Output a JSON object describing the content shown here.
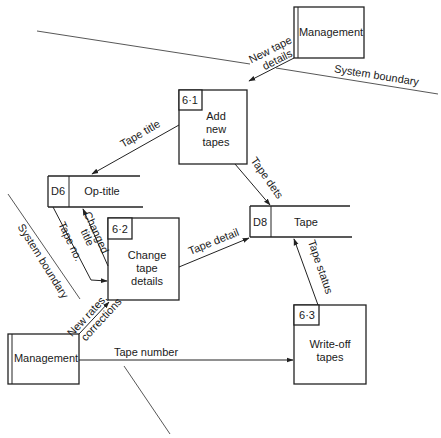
{
  "diagram": {
    "type": "data-flow-diagram",
    "boundaries": [
      {
        "id": "boundary-top",
        "label": "System boundary"
      },
      {
        "id": "boundary-left",
        "label": "System boundary"
      },
      {
        "id": "boundary-bottom",
        "label": ""
      }
    ],
    "external_entities": [
      {
        "id": "mgmt-top",
        "label": "Management"
      },
      {
        "id": "mgmt-bottom",
        "label": "Management"
      }
    ],
    "processes": [
      {
        "id": "p61",
        "number": "6·1",
        "lines": [
          "Add",
          "new",
          "tapes"
        ]
      },
      {
        "id": "p62",
        "number": "6·2",
        "lines": [
          "Change",
          "tape",
          "details"
        ]
      },
      {
        "id": "p63",
        "number": "6·3",
        "lines": [
          "Write-off",
          "tapes"
        ]
      }
    ],
    "data_stores": [
      {
        "id": "d6",
        "code": "D6",
        "label": "Op-title"
      },
      {
        "id": "d8",
        "code": "D8",
        "label": "Tape"
      }
    ],
    "flows": [
      {
        "id": "f1",
        "from": "mgmt-top",
        "to": "p61",
        "lines": [
          "New tape",
          "details"
        ]
      },
      {
        "id": "f2",
        "from": "p61",
        "to": "d6",
        "lines": [
          "Tape title"
        ]
      },
      {
        "id": "f3",
        "from": "p61",
        "to": "d8",
        "lines": [
          "Tape dets"
        ]
      },
      {
        "id": "f4",
        "from": "p62",
        "to": "d6",
        "lines": [
          "Changed",
          "title"
        ]
      },
      {
        "id": "f5",
        "from": "d6",
        "to": "p62",
        "lines": [
          "Tape no."
        ]
      },
      {
        "id": "f6",
        "from": "p62",
        "to": "d8",
        "lines": [
          "Tape detail"
        ]
      },
      {
        "id": "f7",
        "from": "mgmt-bottom",
        "to": "p62",
        "lines": [
          "New rates,",
          "corrections"
        ]
      },
      {
        "id": "f8",
        "from": "p63",
        "to": "d8",
        "lines": [
          "Tape status"
        ]
      },
      {
        "id": "f9",
        "from": "mgmt-bottom",
        "to": "p63",
        "lines": [
          "Tape number"
        ]
      }
    ]
  }
}
